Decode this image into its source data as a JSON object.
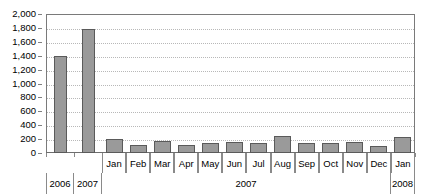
{
  "chart_data": {
    "type": "bar",
    "title": "",
    "subtitle": "",
    "xlabel": "",
    "ylabel": "",
    "ylim": [
      0,
      2000
    ],
    "ytick_step": 200,
    "grid": true,
    "legend": null,
    "legend_position": "none",
    "orientation": "vertical",
    "bar_color": "#9a9a9a",
    "bar_border_color": "#5a5a5a",
    "gridline_color": "#b8b8b8",
    "axis_color": "#7a7a7a",
    "y_ticks": [
      "2,000",
      "1,800",
      "1,600",
      "1,400",
      "1,200",
      "1,000",
      "800",
      "600",
      "400",
      "200",
      "0"
    ],
    "y_tick_values": [
      2000,
      1800,
      1600,
      1400,
      1200,
      1000,
      800,
      600,
      400,
      200,
      0
    ],
    "categories": [
      "2006",
      "2007",
      "Jan",
      "Feb",
      "Mar",
      "Apr",
      "May",
      "Jun",
      "Jul",
      "Aug",
      "Sep",
      "Oct",
      "Nov",
      "Dec",
      "Jan"
    ],
    "values": [
      1400,
      1790,
      200,
      120,
      175,
      115,
      145,
      155,
      140,
      250,
      150,
      150,
      165,
      105,
      230
    ],
    "group_labels": [
      "2006",
      "2007",
      "2007",
      "2008"
    ],
    "groups": [
      {
        "label": "2006",
        "span_start": 0,
        "span_end": 0
      },
      {
        "label": "2007",
        "span_start": 1,
        "span_end": 1
      },
      {
        "label": "2007",
        "span_start": 2,
        "span_end": 13
      },
      {
        "label": "2008",
        "span_start": 14,
        "span_end": 14
      }
    ],
    "points": [
      {
        "category": "2006",
        "group": "2006",
        "value": 1400
      },
      {
        "category": "2007",
        "group": "2007",
        "value": 1790
      },
      {
        "category": "Jan",
        "group": "2007",
        "value": 200
      },
      {
        "category": "Feb",
        "group": "2007",
        "value": 120
      },
      {
        "category": "Mar",
        "group": "2007",
        "value": 175
      },
      {
        "category": "Apr",
        "group": "2007",
        "value": 115
      },
      {
        "category": "May",
        "group": "2007",
        "value": 145
      },
      {
        "category": "Jun",
        "group": "2007",
        "value": 155
      },
      {
        "category": "Jul",
        "group": "2007",
        "value": 140
      },
      {
        "category": "Aug",
        "group": "2007",
        "value": 250
      },
      {
        "category": "Sep",
        "group": "2007",
        "value": 150
      },
      {
        "category": "Oct",
        "group": "2007",
        "value": 150
      },
      {
        "category": "Nov",
        "group": "2007",
        "value": 165
      },
      {
        "category": "Dec",
        "group": "2007",
        "value": 105
      },
      {
        "category": "Jan",
        "group": "2008",
        "value": 230
      }
    ]
  }
}
